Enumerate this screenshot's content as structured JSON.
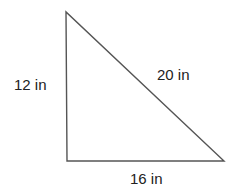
{
  "diagram": {
    "type": "right-triangle",
    "sides": {
      "vertical": "12 in",
      "hypotenuse": "20 in",
      "horizontal": "16 in"
    },
    "stroke_color": "#555555"
  }
}
